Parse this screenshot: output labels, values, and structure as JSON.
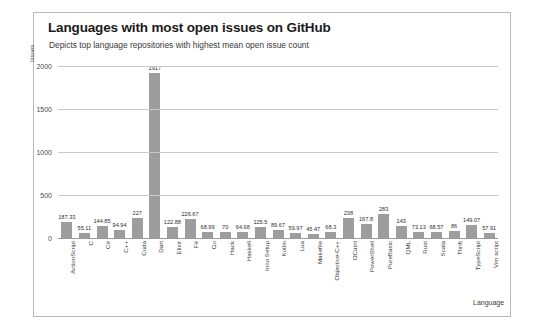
{
  "chart_data": {
    "type": "bar",
    "title": "Languages with most open issues on GitHub",
    "subtitle": "Depicts top language repositories with highest mean open issue count",
    "xlabel": "Language",
    "ylabel": "Issues",
    "ylim": [
      0,
      2000
    ],
    "yticks": [
      0,
      500,
      1000,
      1500,
      2000
    ],
    "ytick_labels": [
      "0",
      "500",
      "1000",
      "1500",
      "2000"
    ],
    "grid": true,
    "legend": "none",
    "bar_color": "#9d9d9d",
    "categories": [
      "ActionScript",
      "C",
      "C#",
      "C++",
      "Cuda",
      "Dart",
      "Elixir",
      "F#",
      "Go",
      "Hack",
      "Haskell",
      "Inno Setup",
      "Kotlin",
      "Lua",
      "Makefile",
      "Objective-C++",
      "OCaml",
      "PowerShell",
      "PureBasic",
      "QML",
      "Rust",
      "Scala",
      "Thrift",
      "TypeScript",
      "Vim script"
    ],
    "values": [
      187.33,
      55.11,
      144.85,
      94.94,
      227,
      1917,
      122.88,
      226.67,
      68.99,
      70,
      64.68,
      125.5,
      89.67,
      59.97,
      45.47,
      68.3,
      238,
      167.8,
      283,
      143,
      73.13,
      68.57,
      86,
      149.07,
      57.91
    ],
    "value_labels": [
      "187.33",
      "55.11",
      "144.85",
      "94.94",
      "227",
      "1917",
      "122.88",
      "226.67",
      "68.99",
      "70",
      "64.68",
      "125.5",
      "89.67",
      "59.97",
      "45.47",
      "68.3",
      "238",
      "167.8",
      "283",
      "143",
      "73.13",
      "68.57",
      "86",
      "149.07",
      "57.91"
    ]
  }
}
